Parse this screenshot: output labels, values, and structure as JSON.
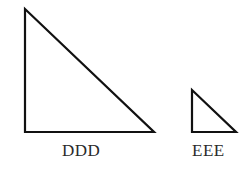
{
  "diagram": {
    "shapes": [
      {
        "name": "triangle-ddd",
        "label": "DDD",
        "points": [
          [
            25,
            9
          ],
          [
            25,
            132
          ],
          [
            154,
            132
          ]
        ]
      },
      {
        "name": "triangle-eee",
        "label": "EEE",
        "points": [
          [
            192,
            90
          ],
          [
            192,
            132
          ],
          [
            236,
            132
          ]
        ]
      }
    ],
    "stroke_color": "#111111"
  }
}
